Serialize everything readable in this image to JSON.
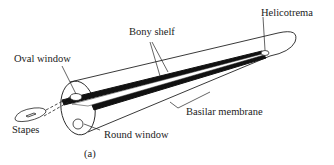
{
  "figure": {
    "panel_label": "(a)",
    "labels": {
      "helicotrema": "Helicotrema",
      "bony_shelf": "Bony shelf",
      "oval_window": "Oval window",
      "basilar_membrane": "Basilar membrane",
      "stapes": "Stapes",
      "round_window": "Round window"
    }
  }
}
